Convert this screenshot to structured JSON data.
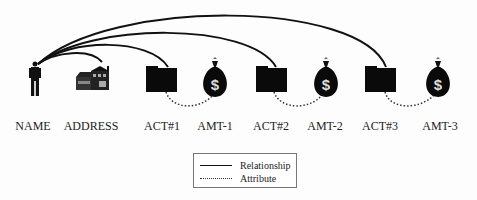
{
  "diagram": {
    "nodes": [
      {
        "id": "name",
        "label": "NAME",
        "icon": "person-icon",
        "x": 33
      },
      {
        "id": "address",
        "label": "ADDRESS",
        "icon": "house-icon",
        "x": 91
      },
      {
        "id": "act1",
        "label": "ACT#1",
        "icon": "folder-icon",
        "x": 162
      },
      {
        "id": "amt1",
        "label": "AMT-1",
        "icon": "money-bag-icon",
        "x": 215
      },
      {
        "id": "act2",
        "label": "ACT#2",
        "icon": "folder-icon",
        "x": 271
      },
      {
        "id": "amt2",
        "label": "AMT-2",
        "icon": "money-bag-icon",
        "x": 325
      },
      {
        "id": "act3",
        "label": "ACT#3",
        "icon": "folder-icon",
        "x": 380
      },
      {
        "id": "amt3",
        "label": "AMT-3",
        "icon": "money-bag-icon",
        "x": 440
      }
    ],
    "edges": [
      {
        "from": "name",
        "to": "address",
        "type": "relationship"
      },
      {
        "from": "name",
        "to": "act1",
        "type": "relationship"
      },
      {
        "from": "name",
        "to": "act2",
        "type": "relationship"
      },
      {
        "from": "name",
        "to": "act3",
        "type": "relationship"
      },
      {
        "from": "act1",
        "to": "amt1",
        "type": "attribute"
      },
      {
        "from": "act2",
        "to": "amt2",
        "type": "attribute"
      },
      {
        "from": "act3",
        "to": "amt3",
        "type": "attribute"
      }
    ]
  },
  "legend": {
    "relationship_label": "Relationship",
    "attribute_label": "Attribute"
  }
}
